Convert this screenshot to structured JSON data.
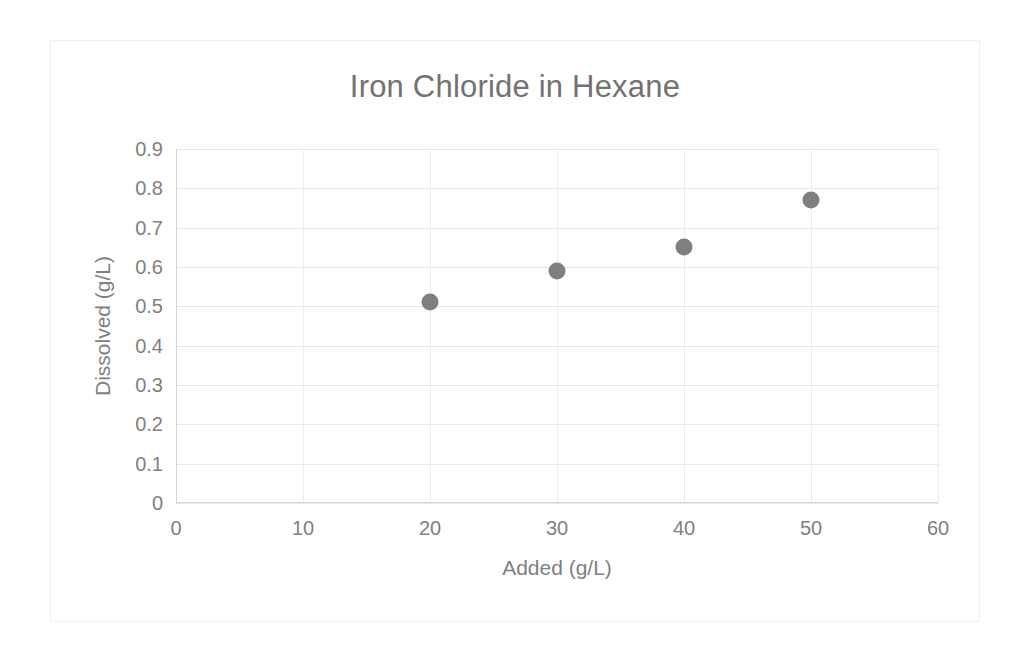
{
  "chart_data": {
    "type": "scatter",
    "title": "Iron Chloride in Hexane",
    "xlabel": "Added (g/L)",
    "ylabel": "Dissolved (g/L)",
    "xlim": [
      0,
      60
    ],
    "ylim": [
      0,
      0.9
    ],
    "xticks": [
      "0",
      "10",
      "20",
      "30",
      "40",
      "50",
      "60"
    ],
    "xtick_values": [
      0,
      10,
      20,
      30,
      40,
      50,
      60
    ],
    "yticks": [
      "0",
      "0.1",
      "0.2",
      "0.3",
      "0.4",
      "0.5",
      "0.6",
      "0.7",
      "0.8",
      "0.9"
    ],
    "ytick_values": [
      0,
      0.1,
      0.2,
      0.3,
      0.4,
      0.5,
      0.6,
      0.7,
      0.8,
      0.9
    ],
    "grid": true,
    "legend": false,
    "marker_color": "#7f7f7f",
    "series": [
      {
        "name": "Dissolved",
        "x": [
          20,
          30,
          40,
          50
        ],
        "y": [
          0.51,
          0.59,
          0.65,
          0.77
        ]
      }
    ],
    "points": [
      {
        "x": 20,
        "y": 0.51
      },
      {
        "x": 30,
        "y": 0.59
      },
      {
        "x": 40,
        "y": 0.65
      },
      {
        "x": 50,
        "y": 0.77
      }
    ]
  }
}
